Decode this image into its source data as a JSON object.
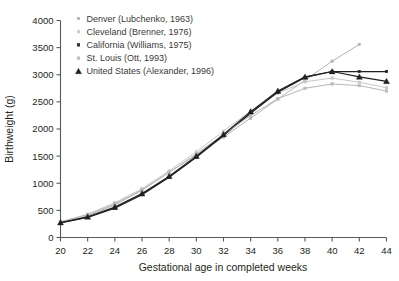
{
  "chart_data": {
    "type": "line",
    "title": "",
    "xlabel": "Gestational age in completed weeks",
    "ylabel": "Birthweight (g)",
    "xlim": [
      20,
      44
    ],
    "ylim": [
      0,
      4000
    ],
    "xticks": [
      20,
      22,
      24,
      26,
      28,
      30,
      32,
      34,
      36,
      38,
      40,
      42,
      44
    ],
    "yticks": [
      0,
      500,
      1000,
      1500,
      2000,
      2500,
      3000,
      3500,
      4000
    ],
    "grid": false,
    "legend_position": "top-left",
    "series": [
      {
        "name": "Denver (Lubchenko, 1963)",
        "color": "#b3b3b3",
        "marker": "square",
        "x": [
          20,
          22,
          24,
          26,
          28,
          30,
          32,
          34,
          36,
          38,
          40,
          42
        ],
        "values": [
          280,
          400,
          600,
          870,
          1200,
          1520,
          1850,
          2200,
          2550,
          2900,
          3250,
          3560
        ]
      },
      {
        "name": "Cleveland (Brenner, 1976)",
        "color": "#c8c8c8",
        "marker": "square",
        "x": [
          20,
          22,
          24,
          26,
          28,
          30,
          32,
          34,
          36,
          38,
          40,
          42,
          44
        ],
        "values": [
          285,
          430,
          640,
          900,
          1230,
          1580,
          1960,
          2330,
          2660,
          2870,
          2940,
          2860,
          2760
        ]
      },
      {
        "name": "California (Williams, 1975)",
        "color": "#231f20",
        "marker": "square",
        "x": [
          20,
          22,
          24,
          26,
          28,
          30,
          32,
          34,
          36,
          38,
          40,
          42,
          44
        ],
        "values": [
          270,
          370,
          540,
          790,
          1110,
          1480,
          1880,
          2290,
          2680,
          2950,
          3060,
          3060,
          3060
        ]
      },
      {
        "name": "St. Louis (Ott, 1993)",
        "color": "#b8b8b8",
        "marker": "square",
        "x": [
          20,
          22,
          24,
          26,
          28,
          30,
          32,
          34,
          36,
          38,
          40,
          42,
          44
        ],
        "values": [
          290,
          420,
          620,
          880,
          1200,
          1540,
          1900,
          2250,
          2560,
          2750,
          2830,
          2800,
          2700
        ]
      },
      {
        "name": "United States (Alexander, 1996)",
        "color": "#231f20",
        "marker": "triangle",
        "x": [
          20,
          22,
          24,
          26,
          28,
          30,
          32,
          34,
          36,
          38,
          40,
          42,
          44
        ],
        "values": [
          275,
          380,
          560,
          810,
          1130,
          1500,
          1900,
          2320,
          2700,
          2960,
          3060,
          2960,
          2880
        ]
      }
    ]
  },
  "legend": {
    "items": [
      {
        "label": "Denver (Lubchenko, 1963)"
      },
      {
        "label": "Cleveland (Brenner, 1976)"
      },
      {
        "label": "California (Williams, 1975)"
      },
      {
        "label": "St. Louis (Ott, 1993)"
      },
      {
        "label": "United States (Alexander, 1996)"
      }
    ]
  }
}
